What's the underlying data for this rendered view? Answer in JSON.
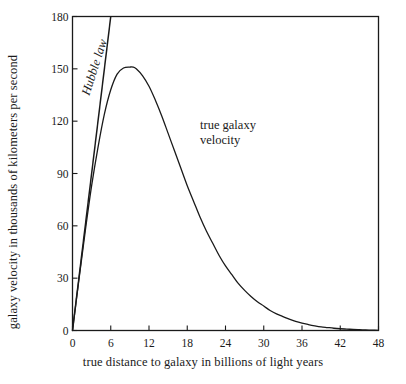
{
  "chart_data": {
    "type": "line",
    "title": "",
    "subtitle": "",
    "xlabel": "true distance to galaxy in billions of light years",
    "ylabel": "galaxy velocity in thousands of kilometers per second",
    "xlim": [
      0,
      48
    ],
    "ylim": [
      0,
      180
    ],
    "xticks": [
      0,
      6,
      12,
      18,
      24,
      30,
      36,
      42,
      48
    ],
    "yticks": [
      0,
      30,
      60,
      90,
      120,
      150,
      180
    ],
    "xtick_labels": [
      "0",
      "6",
      "12",
      "18",
      "24",
      "30",
      "36",
      "42",
      "48"
    ],
    "ytick_labels": [
      "0",
      "30",
      "60",
      "90",
      "120",
      "150",
      "180"
    ],
    "grid": false,
    "legend_position": "none",
    "frame": "box",
    "line_color": "#1a1a1a",
    "background_color": "#ffffff",
    "series": [
      {
        "name": "Hubble law",
        "style": "straight-line",
        "slope_per_unit": 30,
        "x": [
          0,
          6
        ],
        "values": [
          0,
          180
        ]
      },
      {
        "name": "true galaxy velocity",
        "style": "curve",
        "peak_x": 9.5,
        "peak_y": 151,
        "x": [
          0,
          1,
          2,
          3,
          4,
          5,
          6,
          7,
          8,
          9,
          9.5,
          10,
          11,
          12,
          13,
          14,
          15,
          16,
          17,
          18,
          19,
          20,
          21,
          22,
          23,
          24,
          25,
          26,
          27,
          28,
          29,
          30,
          31,
          32,
          33,
          34,
          35,
          36,
          37,
          38,
          39,
          40,
          41,
          42,
          43,
          44,
          45,
          46,
          47,
          48
        ],
        "values": [
          0,
          29,
          57,
          83,
          105,
          124,
          138,
          147,
          150.5,
          151,
          151,
          150,
          146,
          140,
          132,
          123,
          113,
          103,
          93,
          83,
          74,
          65,
          57,
          50,
          43,
          37,
          32,
          27,
          23,
          19.5,
          16.5,
          14,
          11.5,
          9.5,
          8,
          6.5,
          5.2,
          4.2,
          3.4,
          2.7,
          2.1,
          1.7,
          1.3,
          1.0,
          0.8,
          0.6,
          0.45,
          0.32,
          0.2,
          0.1
        ]
      }
    ],
    "annotations": [
      {
        "name": "hubble-law",
        "text": "Hubble law",
        "style": "italic",
        "rotation_deg": -72,
        "at_x": 2.1,
        "at_y": 135
      },
      {
        "name": "true-galaxy-velocity",
        "line1": "true galaxy",
        "line2": "velocity",
        "style": "normal",
        "rotation_deg": 0,
        "at_x": 20,
        "at_y": 122
      }
    ]
  }
}
